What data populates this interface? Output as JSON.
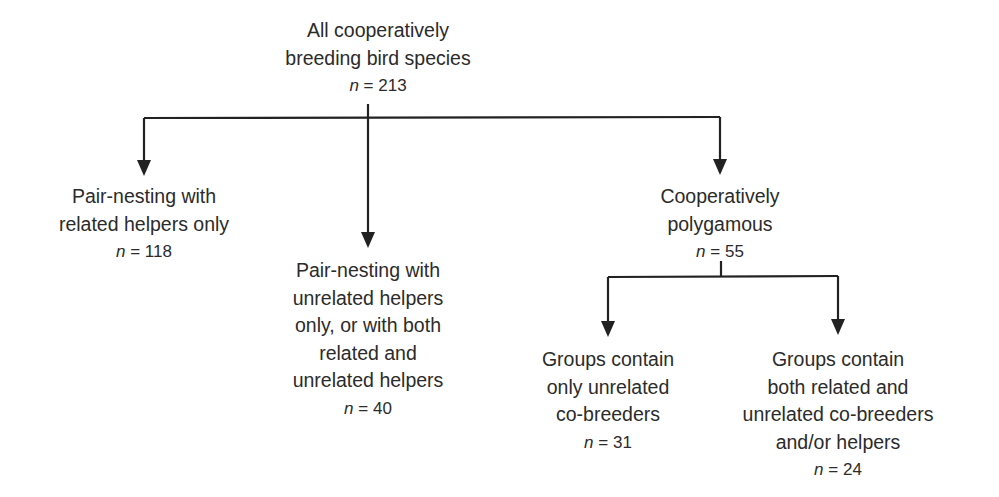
{
  "diagram": {
    "type": "tree",
    "line_color": "#222222",
    "text_color": "#2b2b2b",
    "nodes": {
      "root": {
        "lines": [
          "All cooperatively",
          "breeding bird species"
        ],
        "n_label": "n",
        "n_value": "= 213"
      },
      "pair_related": {
        "lines": [
          "Pair-nesting with",
          "related helpers only"
        ],
        "n_label": "n",
        "n_value": "= 118"
      },
      "pair_unrelated": {
        "lines": [
          "Pair-nesting with",
          "unrelated helpers",
          "only, or with both",
          "related and",
          "unrelated helpers"
        ],
        "n_label": "n",
        "n_value": "= 40"
      },
      "polygamous": {
        "lines": [
          "Cooperatively",
          "polygamous"
        ],
        "n_label": "n",
        "n_value": "= 55"
      },
      "only_unrelated": {
        "lines": [
          "Groups contain",
          "only unrelated",
          "co-breeders"
        ],
        "n_label": "n",
        "n_value": "= 31"
      },
      "both": {
        "lines": [
          "Groups contain",
          "both related and",
          "unrelated co-breeders",
          "and/or helpers"
        ],
        "n_label": "n",
        "n_value": "= 24"
      }
    },
    "edges": [
      [
        "root",
        "pair_related"
      ],
      [
        "root",
        "pair_unrelated"
      ],
      [
        "root",
        "polygamous"
      ],
      [
        "polygamous",
        "only_unrelated"
      ],
      [
        "polygamous",
        "both"
      ]
    ]
  }
}
